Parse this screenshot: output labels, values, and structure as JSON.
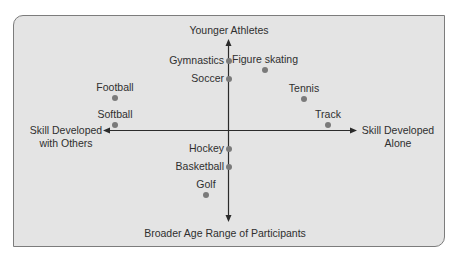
{
  "diagram": {
    "type": "quadrant-map",
    "axes": {
      "top": "Younger Athletes",
      "bottom": "Broader Age Range of Participants",
      "left": [
        "Skill Developed",
        "with Others"
      ],
      "right": [
        "Skill Developed",
        "Alone"
      ]
    },
    "colors": {
      "panel_fill": "#e4e4e4",
      "panel_border": "#7c7c7c",
      "axis": "#2b2b2b",
      "dot": "#7a7a7a",
      "text": "#2f2f2f"
    },
    "points": [
      {
        "label": "Gymnastics",
        "x": 229,
        "y": 61,
        "label_pos": "left"
      },
      {
        "label": "Figure skating",
        "x": 265,
        "y": 70,
        "label_pos": "above"
      },
      {
        "label": "Soccer",
        "x": 229,
        "y": 79,
        "label_pos": "left"
      },
      {
        "label": "Football",
        "x": 115,
        "y": 98,
        "label_pos": "above"
      },
      {
        "label": "Softball",
        "x": 115,
        "y": 125,
        "label_pos": "above"
      },
      {
        "label": "Tennis",
        "x": 304,
        "y": 99,
        "label_pos": "above"
      },
      {
        "label": "Track",
        "x": 328,
        "y": 125,
        "label_pos": "above"
      },
      {
        "label": "Hockey",
        "x": 229,
        "y": 149,
        "label_pos": "left"
      },
      {
        "label": "Basketball",
        "x": 229,
        "y": 167,
        "label_pos": "left"
      },
      {
        "label": "Golf",
        "x": 206,
        "y": 195,
        "label_pos": "above"
      }
    ]
  }
}
